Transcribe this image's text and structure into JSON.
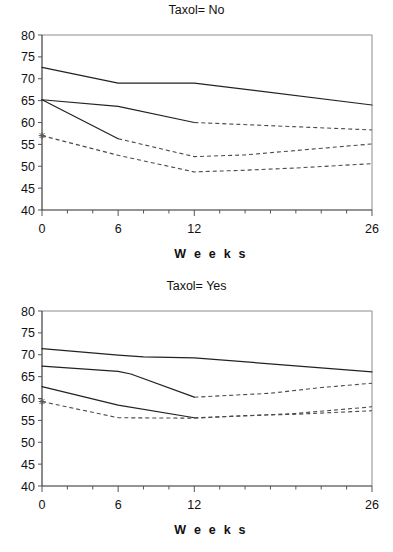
{
  "page": {
    "background": "#ffffff",
    "width": 393,
    "height": 552
  },
  "panels": [
    {
      "title": "Taxol= No",
      "xlabel": "W e e k s"
    },
    {
      "title": "Taxol= Yes",
      "xlabel": "W e e k s"
    }
  ],
  "axis": {
    "y_ticks": [
      "80",
      "75",
      "70",
      "65",
      "60",
      "55",
      "50",
      "45",
      "40"
    ],
    "x_ticks": [
      "0",
      "6",
      "12",
      "26"
    ]
  },
  "chart_data": [
    {
      "type": "line",
      "title": "Taxol= No",
      "xlabel": "W e e k s",
      "ylabel": "",
      "xlim": [
        0,
        26
      ],
      "ylim": [
        40,
        80
      ],
      "yticks": [
        40,
        45,
        50,
        55,
        60,
        65,
        70,
        75,
        80
      ],
      "xticks": [
        0,
        6,
        12,
        26
      ],
      "grid": false,
      "legend": "none",
      "annotations": [
        {
          "label": "star-marker",
          "x": 0,
          "y": 57.0
        }
      ],
      "series": [
        {
          "name": "series-1-solid-upper",
          "style": "solid",
          "x": [
            0,
            6,
            10,
            12,
            26
          ],
          "values": [
            72.6,
            69.0,
            69.0,
            69.0,
            64.0
          ]
        },
        {
          "name": "series-2-solid-mid",
          "style": "solid",
          "x": [
            0,
            6,
            12
          ],
          "values": [
            65.2,
            63.7,
            60.0
          ]
        },
        {
          "name": "series-2-dashed-mid",
          "style": "dashed",
          "x": [
            12,
            26
          ],
          "values": [
            60.0,
            58.3
          ]
        },
        {
          "name": "series-3-solid-steep",
          "style": "solid",
          "x": [
            0,
            6
          ],
          "values": [
            65.2,
            56.3
          ]
        },
        {
          "name": "series-3-dashed-lower",
          "style": "dashed",
          "x": [
            6,
            12,
            16,
            20,
            26
          ],
          "values": [
            56.3,
            52.2,
            52.6,
            53.6,
            55.1
          ]
        },
        {
          "name": "series-4-dashed-bottom",
          "style": "dashed",
          "x": [
            0,
            6,
            12,
            16,
            20,
            26
          ],
          "values": [
            57.0,
            52.5,
            48.7,
            49.1,
            49.6,
            50.6
          ]
        }
      ]
    },
    {
      "type": "line",
      "title": "Taxol= Yes",
      "xlabel": "W e e k s",
      "ylabel": "",
      "xlim": [
        0,
        26
      ],
      "ylim": [
        40,
        80
      ],
      "yticks": [
        40,
        45,
        50,
        55,
        60,
        65,
        70,
        75,
        80
      ],
      "xticks": [
        0,
        6,
        12,
        26
      ],
      "grid": false,
      "legend": "none",
      "annotations": [
        {
          "label": "star-marker",
          "x": 0,
          "y": 59.3
        }
      ],
      "series": [
        {
          "name": "series-1-solid-upper",
          "style": "solid",
          "x": [
            0,
            6,
            8,
            12,
            26
          ],
          "values": [
            71.4,
            69.9,
            69.5,
            69.3,
            66.1
          ]
        },
        {
          "name": "series-2-solid-mid",
          "style": "solid",
          "x": [
            0,
            6,
            7,
            12
          ],
          "values": [
            67.4,
            66.2,
            65.6,
            60.3
          ]
        },
        {
          "name": "series-2-dashed-mid",
          "style": "dashed",
          "x": [
            12,
            18,
            22,
            26
          ],
          "values": [
            60.3,
            61.2,
            62.5,
            63.5
          ]
        },
        {
          "name": "series-3-solid-lower",
          "style": "solid",
          "x": [
            0,
            6,
            12
          ],
          "values": [
            62.7,
            58.5,
            55.6
          ]
        },
        {
          "name": "series-3-dashed-lower",
          "style": "dashed",
          "x": [
            12,
            16,
            20,
            26
          ],
          "values": [
            55.6,
            56.0,
            56.6,
            58.1
          ]
        },
        {
          "name": "series-4-dashed-bottom",
          "style": "dashed",
          "x": [
            0,
            6,
            12,
            16,
            20,
            26
          ],
          "values": [
            59.3,
            55.6,
            55.5,
            56.1,
            56.4,
            57.2
          ]
        }
      ]
    }
  ]
}
